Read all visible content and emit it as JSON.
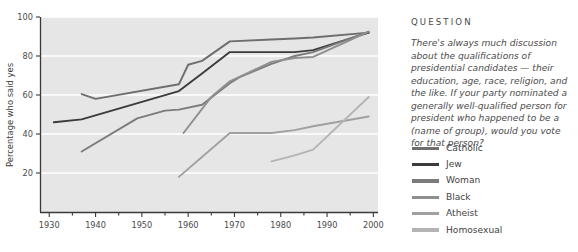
{
  "question": {
    "heading": "QUESTION",
    "body": "There's always much discussion about the qualifications of presidential candidates — their education, age, race, religion, and the like. If your party nominated a generally well-qualified person for president who happened to be a (name of group), would you vote for that person?"
  },
  "chart_data": {
    "type": "line",
    "title": "",
    "xlabel": "",
    "ylabel": "Percentage who said yes",
    "xlim": [
      1928,
      2001
    ],
    "ylim": [
      0,
      100
    ],
    "xticks": [
      1930,
      1940,
      1950,
      1960,
      1970,
      1980,
      1990,
      2000
    ],
    "xtick_labels": [
      "1930",
      "1940",
      "1950",
      "1960",
      "1970",
      "1980",
      "1990",
      "2000"
    ],
    "xminor_ticks": [
      1935,
      1945,
      1955,
      1965,
      1975,
      1985,
      1995
    ],
    "yticks": [
      20,
      40,
      60,
      80,
      100
    ],
    "ytick_labels": [
      "20",
      "40",
      "60",
      "80",
      "100"
    ],
    "grid": "horizontal-white",
    "plot_background": "#e6e6e6",
    "legend_position": "right",
    "series": [
      {
        "name": "Catholic",
        "color": "#6e6e6e",
        "points": [
          [
            1937,
            60.5
          ],
          [
            1940,
            58.0
          ],
          [
            1958,
            65.5
          ],
          [
            1960,
            75.5
          ],
          [
            1963,
            77.5
          ],
          [
            1969,
            87.5
          ],
          [
            1978,
            88.5
          ],
          [
            1983,
            89.0
          ],
          [
            1987,
            89.5
          ],
          [
            1999,
            92.0
          ]
        ]
      },
      {
        "name": "Jew",
        "color": "#3b3b3b",
        "points": [
          [
            1931,
            46.0
          ],
          [
            1937,
            47.5
          ],
          [
            1958,
            62.0
          ],
          [
            1963,
            71.0
          ],
          [
            1969,
            82.0
          ],
          [
            1978,
            82.0
          ],
          [
            1983,
            82.0
          ],
          [
            1987,
            83.0
          ],
          [
            1999,
            92.0
          ]
        ]
      },
      {
        "name": "Woman",
        "color": "#7b7b7b",
        "points": [
          [
            1937,
            31.0
          ],
          [
            1949,
            48.0
          ],
          [
            1955,
            52.0
          ],
          [
            1958,
            52.5
          ],
          [
            1963,
            55.0
          ],
          [
            1969,
            66.0
          ],
          [
            1971,
            69.0
          ],
          [
            1978,
            76.0
          ],
          [
            1983,
            80.0
          ],
          [
            1987,
            82.0
          ],
          [
            1999,
            92.5
          ]
        ]
      },
      {
        "name": "Black",
        "color": "#8f8f8f",
        "points": [
          [
            1959,
            40.5
          ],
          [
            1965,
            59.0
          ],
          [
            1969,
            67.0
          ],
          [
            1978,
            77.0
          ],
          [
            1983,
            79.0
          ],
          [
            1987,
            79.5
          ],
          [
            1999,
            92.5
          ]
        ]
      },
      {
        "name": "Atheist",
        "color": "#a0a0a0",
        "points": [
          [
            1958,
            18.0
          ],
          [
            1969,
            40.5
          ],
          [
            1978,
            40.5
          ],
          [
            1983,
            42.0
          ],
          [
            1987,
            44.0
          ],
          [
            1999,
            49.0
          ]
        ]
      },
      {
        "name": "Homosexual",
        "color": "#b4b4b4",
        "points": [
          [
            1978,
            26.0
          ],
          [
            1983,
            29.0
          ],
          [
            1987,
            32.0
          ],
          [
            1999,
            59.0
          ]
        ]
      }
    ]
  },
  "legend": {
    "items": [
      {
        "label": "Catholic",
        "color": "#6e6e6e"
      },
      {
        "label": "Jew",
        "color": "#3b3b3b"
      },
      {
        "label": "Woman",
        "color": "#7b7b7b"
      },
      {
        "label": "Black",
        "color": "#8f8f8f"
      },
      {
        "label": "Atheist",
        "color": "#a0a0a0"
      },
      {
        "label": "Homosexual",
        "color": "#b4b4b4"
      }
    ]
  }
}
